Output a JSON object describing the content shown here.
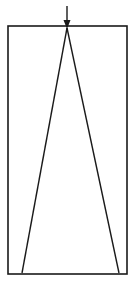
{
  "diagram": {
    "type": "line-drawing",
    "stroke_color": "#1a1a1a",
    "background": "#ffffff",
    "rectangle": {
      "x1": 8,
      "y1": 26,
      "x2": 127,
      "y2": 274
    },
    "arrow": {
      "x": 67,
      "y_start": 6,
      "y_end": 29
    },
    "triangle": {
      "apex": [
        67,
        28
      ],
      "left_base": [
        22,
        273
      ],
      "right_base": [
        119,
        273
      ]
    }
  }
}
